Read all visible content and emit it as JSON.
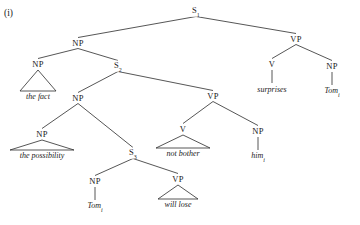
{
  "figure": {
    "example_number": "(i)",
    "type": "syntax-tree",
    "line_color": "#2b2b2b"
  },
  "tree": {
    "nodes": [
      {
        "id": "s1",
        "label": "S",
        "subscript": "1",
        "x": 196,
        "y": 11,
        "kind": "nonterminal"
      },
      {
        "id": "np_top",
        "label": "NP",
        "subscript": "",
        "x": 78,
        "y": 43,
        "kind": "nonterminal"
      },
      {
        "id": "vp_top",
        "label": "VP",
        "subscript": "",
        "x": 296,
        "y": 39,
        "kind": "nonterminal"
      },
      {
        "id": "np_fact",
        "label": "NP",
        "subscript": "",
        "x": 38,
        "y": 64,
        "kind": "nonterminal"
      },
      {
        "id": "s2",
        "label": "S",
        "subscript": "2",
        "x": 118,
        "y": 66,
        "kind": "nonterminal"
      },
      {
        "id": "v_surp",
        "label": "V",
        "subscript": "",
        "x": 272,
        "y": 64,
        "kind": "nonterminal"
      },
      {
        "id": "np_tom_hi",
        "label": "NP",
        "subscript": "",
        "x": 332,
        "y": 66,
        "kind": "nonterminal"
      },
      {
        "id": "np_mid",
        "label": "NP",
        "subscript": "",
        "x": 78,
        "y": 98,
        "kind": "nonterminal"
      },
      {
        "id": "vp_mid",
        "label": "VP",
        "subscript": "",
        "x": 213,
        "y": 96,
        "kind": "nonterminal"
      },
      {
        "id": "np_poss",
        "label": "NP",
        "subscript": "",
        "x": 42,
        "y": 134,
        "kind": "nonterminal"
      },
      {
        "id": "s3",
        "label": "S",
        "subscript": "3",
        "x": 133,
        "y": 153,
        "kind": "nonterminal"
      },
      {
        "id": "v_bother",
        "label": "V",
        "subscript": "",
        "x": 183,
        "y": 129,
        "kind": "nonterminal"
      },
      {
        "id": "np_him",
        "label": "NP",
        "subscript": "",
        "x": 258,
        "y": 131,
        "kind": "nonterminal"
      },
      {
        "id": "np_tom_lo",
        "label": "NP",
        "subscript": "",
        "x": 95,
        "y": 181,
        "kind": "nonterminal"
      },
      {
        "id": "vp_lo",
        "label": "VP",
        "subscript": "",
        "x": 178,
        "y": 179,
        "kind": "nonterminal"
      }
    ],
    "edges": [
      {
        "from": "s1",
        "to": "np_top"
      },
      {
        "from": "s1",
        "to": "vp_top"
      },
      {
        "from": "np_top",
        "to": "np_fact"
      },
      {
        "from": "np_top",
        "to": "s2"
      },
      {
        "from": "vp_top",
        "to": "v_surp"
      },
      {
        "from": "vp_top",
        "to": "np_tom_hi"
      },
      {
        "from": "s2",
        "to": "np_mid"
      },
      {
        "from": "s2",
        "to": "vp_mid"
      },
      {
        "from": "np_mid",
        "to": "np_poss"
      },
      {
        "from": "np_mid",
        "to": "s3"
      },
      {
        "from": "vp_mid",
        "to": "v_bother"
      },
      {
        "from": "vp_mid",
        "to": "np_him"
      },
      {
        "from": "s3",
        "to": "np_tom_lo"
      },
      {
        "from": "s3",
        "to": "vp_lo"
      }
    ],
    "triangles": [
      {
        "id": "tri_fact",
        "parent": "np_fact",
        "text": "the fact",
        "subscript": "",
        "apex_x": 38,
        "apex_y": 70,
        "half_width": 18,
        "base_y": 91,
        "text_x": 38,
        "text_y": 97
      },
      {
        "id": "tri_poss",
        "parent": "np_poss",
        "text": "the possibility",
        "subscript": "",
        "apex_x": 42,
        "apex_y": 140,
        "half_width": 32,
        "base_y": 150,
        "text_x": 42,
        "text_y": 156
      },
      {
        "id": "tri_bother",
        "parent": "v_bother",
        "text": "not bother",
        "subscript": "",
        "apex_x": 183,
        "apex_y": 135,
        "half_width": 27,
        "base_y": 148,
        "text_x": 183,
        "text_y": 154
      },
      {
        "id": "tri_lose",
        "parent": "vp_lo",
        "text": "will lose",
        "subscript": "",
        "apex_x": 178,
        "apex_y": 185,
        "half_width": 20,
        "base_y": 199,
        "text_x": 178,
        "text_y": 205
      }
    ],
    "stems": [
      {
        "id": "stem_surp",
        "parent": "v_surp",
        "text": "surprises",
        "subscript": "",
        "x": 272,
        "top_y": 70,
        "bottom_y": 83,
        "text_y": 90
      },
      {
        "id": "stem_tomi",
        "parent": "np_tom_hi",
        "text": "Tom",
        "subscript": "i",
        "x": 332,
        "top_y": 72,
        "bottom_y": 85,
        "text_y": 92
      },
      {
        "id": "stem_him",
        "parent": "np_him",
        "text": "him",
        "subscript": "i",
        "x": 258,
        "top_y": 137,
        "bottom_y": 150,
        "text_y": 157
      },
      {
        "id": "stem_tom2",
        "parent": "np_tom_lo",
        "text": "Tom",
        "subscript": "i",
        "x": 95,
        "top_y": 187,
        "bottom_y": 200,
        "text_y": 207
      }
    ]
  }
}
